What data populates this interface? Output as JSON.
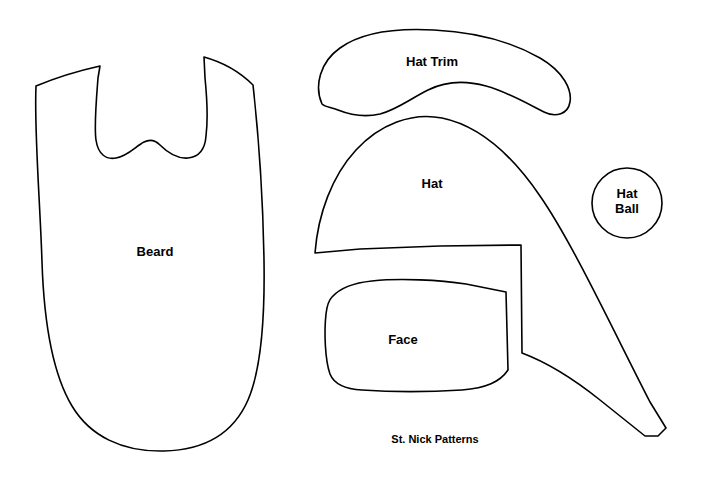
{
  "sheet": {
    "caption": "St. Nick Patterns",
    "caption_x": 435,
    "caption_y": 439,
    "caption_size": 11,
    "background_color": "#FFFFFF",
    "outline_color": "#000000",
    "fill_color": "#FFFFFF",
    "width": 706,
    "height": 478
  },
  "pieces": [
    {
      "id": "beard",
      "label": "Beard",
      "label_x": 155,
      "label_y": 252,
      "label_size": 13,
      "path": "M 36 86 C 60 76 82 70 100 66 L 98 78 C 96 104 94 126 96 140 C 98 154 106 160 116 158 C 128 156 136 146 144 142 C 150 139 155 140 160 145 C 167 152 176 159 188 158 C 198 157 205 150 206 136 C 208 120 207 98 205 78 L 204 57 C 222 62 240 72 253 85 C 258 130 263 200 264 260 C 265 320 261 370 248 400 C 234 432 206 450 164 451 C 122 452 90 436 72 406 C 54 376 44 324 42 262 C 40 200 34 130 36 86 Z"
    },
    {
      "id": "hat-trim",
      "label": "Hat Trim",
      "label_x": 432,
      "label_y": 62,
      "label_size": 13,
      "path": "M 322 104 C 314 86 320 62 340 48 C 362 32 398 28 434 30 C 474 32 512 42 540 58 C 564 72 572 90 570 102 C 568 114 556 118 544 112 C 528 104 508 92 486 86 C 464 80 444 82 428 90 C 410 99 396 110 380 114 C 362 118 348 114 338 110 C 330 107 325 107 322 104 Z"
    },
    {
      "id": "hat",
      "label": "Hat",
      "label_x": 432,
      "label_y": 184,
      "label_size": 13,
      "path": "M 315 253 C 318 214 332 176 356 150 C 380 124 412 112 442 118 C 476 125 510 152 540 196 C 572 242 612 328 650 402 L 666 428 L 658 436 L 645 436 L 600 400 C 570 376 546 362 522 353 L 521 245 L 440 246 L 360 249 Z"
    },
    {
      "id": "hat-ball",
      "label": "Hat\nBall",
      "label_x": 627,
      "label_y": 202,
      "label_size": 13,
      "path": "M 662 203 A 35 35 0 1 1 592 203 A 35 35 0 1 1 662 203 Z"
    },
    {
      "id": "face",
      "label": "Face",
      "label_x": 403,
      "label_y": 340,
      "label_size": 13,
      "path": "M 332 297 C 340 288 352 283 372 281 C 400 278 440 280 466 284 L 506 292 L 508 370 C 500 382 486 388 462 390 C 430 392 390 392 362 390 C 344 389 334 384 330 374 C 325 360 324 332 326 314 C 327 305 329 300 332 297 Z"
    }
  ]
}
